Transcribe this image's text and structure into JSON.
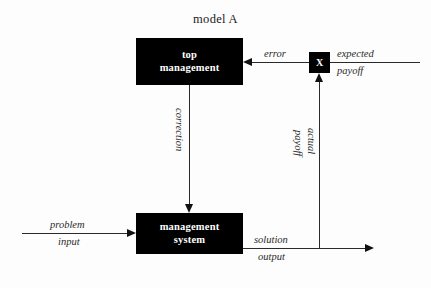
{
  "diagram": {
    "title": "model A",
    "type": "block-diagram",
    "blocks": [
      {
        "id": "top-management",
        "line1": "top",
        "line2": "management",
        "fill": "#000000",
        "text_color": "#ffffff"
      },
      {
        "id": "management-system",
        "line1": "management",
        "line2": "system",
        "fill": "#000000",
        "text_color": "#ffffff"
      },
      {
        "id": "comparator",
        "label": "X",
        "fill": "#000000",
        "text_color": "#ffffff"
      }
    ],
    "edges": [
      {
        "id": "expected-payoff",
        "line1": "expected",
        "line2": "payoff",
        "from": "external-right",
        "to": "comparator",
        "direction": "left"
      },
      {
        "id": "error",
        "label": "error",
        "from": "comparator",
        "to": "top-management",
        "direction": "left"
      },
      {
        "id": "correction",
        "label": "correction",
        "from": "top-management",
        "to": "management-system",
        "direction": "down",
        "orientation": "vertical"
      },
      {
        "id": "problem-input",
        "line1": "problem",
        "line2": "input",
        "from": "external-left",
        "to": "management-system",
        "direction": "right"
      },
      {
        "id": "solution-output",
        "line1": "solution",
        "line2": "output",
        "from": "management-system",
        "to": "external-right",
        "direction": "right"
      },
      {
        "id": "actual-payoff",
        "label_left": "payoff",
        "label_right": "actual",
        "from": "solution-output",
        "to": "comparator",
        "direction": "up",
        "orientation": "vertical"
      }
    ],
    "colors": {
      "background": "#fdfdfd",
      "block_fill": "#000000",
      "block_text": "#ffffff",
      "line": "#2a2a2a",
      "label_text": "#2b2b2b"
    }
  }
}
